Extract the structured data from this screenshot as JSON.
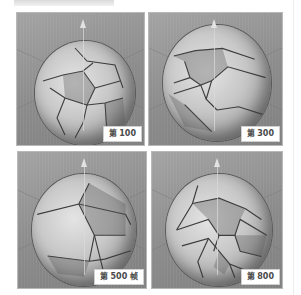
{
  "figure": {
    "panels": [
      {
        "id": "frame-100",
        "label": "第 100"
      },
      {
        "id": "frame-300",
        "label": "第 300"
      },
      {
        "id": "frame-500",
        "label": "第 500 帧"
      },
      {
        "id": "frame-800",
        "label": "第 800"
      }
    ]
  }
}
